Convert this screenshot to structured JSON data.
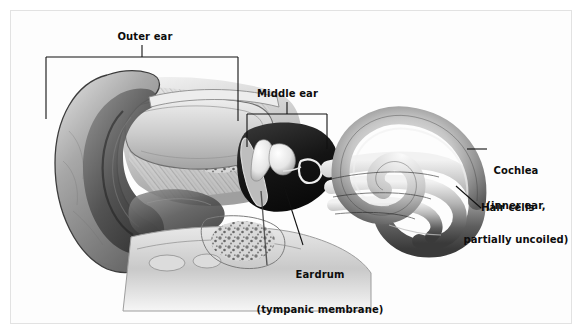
{
  "figure": {
    "type": "anatomical-diagram",
    "background_color": "#fdfdfd",
    "frame_color": "#e2e2e2",
    "label_color": "#0d0d0d",
    "leader_color": "#111111",
    "style": "grayscale medical illustration"
  },
  "labels": {
    "outer_ear": "Outer ear",
    "middle_ear": "Middle ear",
    "eardrum": "Eardrum\n(tympanic membrane)",
    "eardrum_line1": "Eardrum",
    "eardrum_line2": "(tympanic membrane)",
    "cochlea": "Cochlea\n(inner ear,\npartially uncoiled)",
    "cochlea_line1": "Cochlea",
    "cochlea_line2": "(inner ear,",
    "cochlea_line3": "partially uncoiled)",
    "hair_cells": "Hair cells"
  },
  "annotations": [
    {
      "name": "outer-ear",
      "text": "Outer ear",
      "connector": "bracket",
      "bracket": {
        "x1": 45,
        "x2": 237,
        "y": 56,
        "tick_left": 118,
        "tick_right": 120
      },
      "stem": {
        "x": 141,
        "y1": 44,
        "y2": 56
      }
    },
    {
      "name": "middle-ear",
      "text": "Middle ear",
      "connector": "bracket",
      "bracket": {
        "x1": 246,
        "x2": 326,
        "y": 113,
        "tick_left": 146,
        "tick_right": 148
      },
      "stem": {
        "x": 286,
        "y1": 101,
        "y2": 113
      }
    },
    {
      "name": "eardrum",
      "text": "Eardrum (tympanic membrane)",
      "connector": "diagonal-leader",
      "leader": {
        "x1": 283,
        "y1": 185,
        "x2": 302,
        "y2": 244
      }
    },
    {
      "name": "cochlea",
      "text": "Cochlea (inner ear, partially uncoiled)",
      "connector": "horizontal-leader",
      "leader": {
        "x1": 466,
        "y1": 148,
        "x2": 486,
        "y2": 148
      }
    },
    {
      "name": "hair-cells",
      "text": "Hair cells",
      "connector": "diagonal-leader",
      "leader": {
        "x1": 455,
        "y1": 185,
        "x2": 480,
        "y2": 207
      }
    }
  ],
  "anatomy_parts": [
    "pinna (auricle)",
    "ear canal (auditory canal)",
    "tympanic membrane (eardrum)",
    "ossicles (malleus, incus, stapes)",
    "cochlea",
    "hair cells",
    "eustachian tube",
    "temporal bone"
  ]
}
